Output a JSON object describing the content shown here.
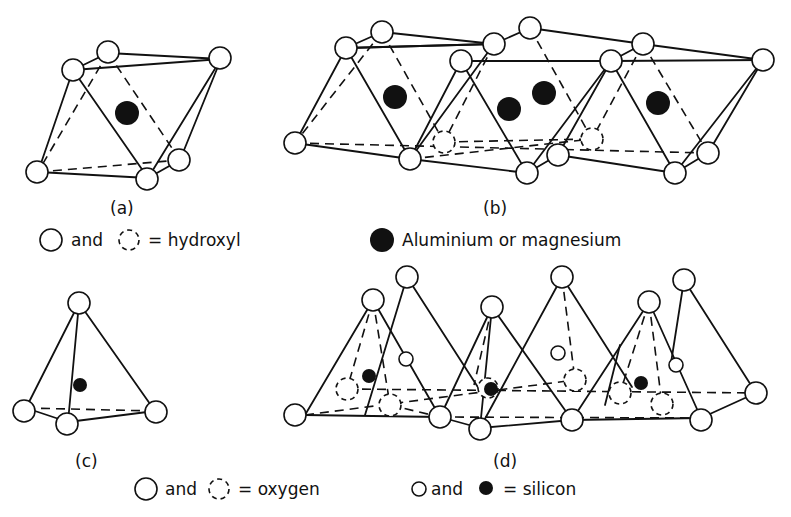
{
  "panels": {
    "a": {
      "label": "(a)",
      "description": "single octahedral unit"
    },
    "b": {
      "label": "(b)",
      "description": "sheet of octahedral units"
    },
    "c": {
      "label": "(c)",
      "description": "single silica tetrahedron"
    },
    "d": {
      "label": "(d)",
      "description": "sheet of silica tetrahedra"
    }
  },
  "legend": {
    "hydroxyl": {
      "word_and": "and",
      "text": "= hydroxyl"
    },
    "metal": {
      "text": "Aluminium or magnesium"
    },
    "oxygen": {
      "word_and": "and",
      "text": "= oxygen"
    },
    "silicon": {
      "word_and": "and",
      "text": "= silicon"
    }
  },
  "colors": {
    "ink": "#111111",
    "paper": "#ffffff"
  }
}
